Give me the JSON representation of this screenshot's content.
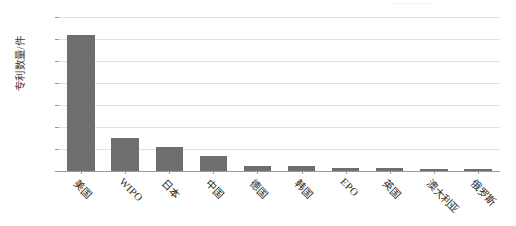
{
  "figure": {
    "background_color": "#ffffff",
    "bar_color": "#6e6e6e",
    "gridline_color": "#e2e2e6",
    "axis_color": "#9a9a9a",
    "clipped_top_caption": "— — — — —"
  },
  "chart_data": {
    "type": "bar",
    "title": "",
    "xlabel": "",
    "ylabel": "专利数量/件",
    "ylim": [
      0,
      70
    ],
    "ytick_labels": [
      "0",
      "10",
      "20",
      "30",
      "40",
      "50",
      "60",
      "70"
    ],
    "ytick_values": [
      0,
      10,
      20,
      30,
      40,
      50,
      60,
      70
    ],
    "grid": "horizontal",
    "legend": "none",
    "categories": [
      "美国",
      "WIPO",
      "日本",
      "中国",
      "德国",
      "韩国",
      "EPO",
      "英国",
      "澳大利亚",
      "俄罗斯"
    ],
    "values": [
      62,
      15,
      11,
      7,
      2.5,
      2.5,
      1.5,
      1.5,
      0.5,
      0.5
    ],
    "series": [
      {
        "name": "专利数量",
        "values": [
          62,
          15,
          11,
          7,
          2.5,
          2.5,
          1.5,
          1.5,
          0.5,
          0.5
        ]
      }
    ]
  }
}
